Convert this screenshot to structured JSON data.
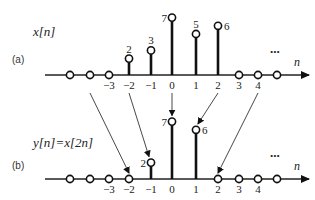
{
  "panels": [
    {
      "id": "a",
      "tag": "(a)",
      "title": "x[n]",
      "axis_label": "n",
      "ellipsis": "...",
      "axis_y": 75,
      "samples": [
        {
          "n": -5,
          "value": 0
        },
        {
          "n": -4,
          "value": 0
        },
        {
          "n": -3,
          "value": 0
        },
        {
          "n": -2,
          "value": 2
        },
        {
          "n": -1,
          "value": 3
        },
        {
          "n": 0,
          "value": 7
        },
        {
          "n": 1,
          "value": 5
        },
        {
          "n": 2,
          "value": 6
        },
        {
          "n": 3,
          "value": 0
        },
        {
          "n": 4,
          "value": 0
        },
        {
          "n": 5,
          "value": 0
        }
      ],
      "tick_labels": [
        {
          "n": -3,
          "text": "−3"
        },
        {
          "n": -2,
          "text": "−2"
        },
        {
          "n": -1,
          "text": "−1"
        },
        {
          "n": 0,
          "text": "0"
        },
        {
          "n": 1,
          "text": "1"
        },
        {
          "n": 2,
          "text": "2"
        },
        {
          "n": 3,
          "text": "3"
        },
        {
          "n": 4,
          "text": "4"
        }
      ]
    },
    {
      "id": "b",
      "tag": "(b)",
      "title": "y[n]=x[2n]",
      "axis_label": "n",
      "ellipsis": "...",
      "axis_y": 179,
      "samples": [
        {
          "n": -5,
          "value": 0
        },
        {
          "n": -4,
          "value": 0
        },
        {
          "n": -3,
          "value": 0
        },
        {
          "n": -2,
          "value": 0
        },
        {
          "n": -1,
          "value": 2
        },
        {
          "n": 0,
          "value": 7
        },
        {
          "n": 1,
          "value": 6
        },
        {
          "n": 2,
          "value": 0
        },
        {
          "n": 3,
          "value": 0
        },
        {
          "n": 4,
          "value": 0
        },
        {
          "n": 5,
          "value": 0
        }
      ],
      "tick_labels": [
        {
          "n": -3,
          "text": "−3"
        },
        {
          "n": -2,
          "text": "−2"
        },
        {
          "n": -1,
          "text": "−1"
        },
        {
          "n": 0,
          "text": "0"
        },
        {
          "n": 1,
          "text": "1"
        },
        {
          "n": 2,
          "text": "2"
        },
        {
          "n": 3,
          "text": "3"
        },
        {
          "n": 4,
          "text": "4"
        }
      ]
    }
  ],
  "mappings": [
    {
      "from_n": -4,
      "to_n": -2
    },
    {
      "from_n": -2,
      "to_n": -1
    },
    {
      "from_n": 0,
      "to_n": 0
    },
    {
      "from_n": 2,
      "to_n": 1
    },
    {
      "from_n": 4,
      "to_n": 2
    }
  ],
  "labels": {
    "a_tag": "(a)",
    "a_title": "x[n]",
    "b_tag": "(b)",
    "b_title": "y[n]=x[2n]"
  }
}
